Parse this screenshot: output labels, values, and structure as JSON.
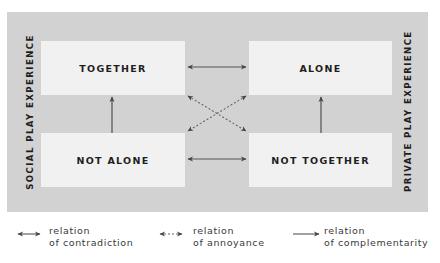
{
  "diagram": {
    "left_axis_label": "SOCIAL PLAY EXPERIENCE",
    "right_axis_label": "PRIVATE PLAY EXPERIENCE",
    "boxes": {
      "top_left": "TOGETHER",
      "top_right": "ALONE",
      "bottom_left": "NOT ALONE",
      "bottom_right": "NOT TOGETHER"
    },
    "relations": [
      {
        "from": "TOGETHER",
        "to": "ALONE",
        "type": "contradiction"
      },
      {
        "from": "NOT ALONE",
        "to": "NOT TOGETHER",
        "type": "contradiction"
      },
      {
        "from": "TOGETHER",
        "to": "NOT TOGETHER",
        "type": "annoyance"
      },
      {
        "from": "ALONE",
        "to": "NOT ALONE",
        "type": "annoyance"
      },
      {
        "from": "NOT ALONE",
        "to": "TOGETHER",
        "type": "complementarity"
      },
      {
        "from": "NOT TOGETHER",
        "to": "ALONE",
        "type": "complementarity"
      }
    ],
    "colors": {
      "panel": "#d2d2d2",
      "box": "#f1f1f1",
      "text": "#1e1e1e",
      "arrow": "#555555"
    }
  },
  "legend": [
    {
      "icon": "double-arrow-solid-icon",
      "line1": "relation",
      "line2": "of contradiction"
    },
    {
      "icon": "double-arrow-dashed-icon",
      "line1": "relation",
      "line2": "of annoyance"
    },
    {
      "icon": "single-arrow-solid-icon",
      "line1": "relation",
      "line2": "of complementarity"
    }
  ]
}
